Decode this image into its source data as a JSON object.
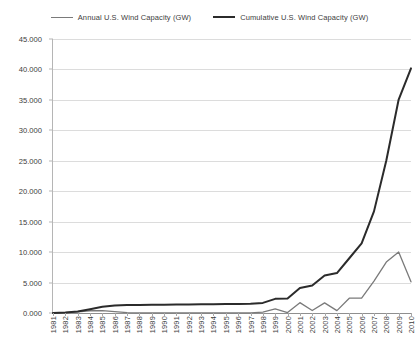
{
  "chart_data": {
    "type": "line",
    "title": "",
    "xlabel": "",
    "ylabel": "",
    "ylim": [
      0,
      45
    ],
    "ytick_interval": 5,
    "grid": "horizontal",
    "legend_position": "top-center",
    "categories": [
      "1981",
      "1982",
      "1983",
      "1984",
      "1985",
      "1986",
      "1987",
      "1988",
      "1989",
      "1990",
      "1991",
      "1992",
      "1993",
      "1994",
      "1995",
      "1996",
      "1997",
      "1998",
      "1999",
      "2000",
      "2001",
      "2002",
      "2003",
      "2004",
      "2005",
      "2006",
      "2007",
      "2008",
      "2009",
      "2010"
    ],
    "ytick_labels": [
      "0.000",
      "5.000",
      "10.000",
      "15.000",
      "20.000",
      "25.000",
      "30.000",
      "35.000",
      "40.000",
      "45.000"
    ],
    "ytick_values": [
      0,
      5,
      10,
      15,
      20,
      25,
      30,
      35,
      40,
      45
    ],
    "series": [
      {
        "name": "Annual U.S. Wind Capacity (GW)",
        "color": "#7a7a7a",
        "width": 1.3,
        "values": [
          0.01,
          0.06,
          0.17,
          0.37,
          0.4,
          0.24,
          0.05,
          0.02,
          0.02,
          0.02,
          0.02,
          0.02,
          0.02,
          0.02,
          0.03,
          0.02,
          0.03,
          0.14,
          0.66,
          0.07,
          1.7,
          0.41,
          1.67,
          0.39,
          2.43,
          2.45,
          5.25,
          8.36,
          10.01,
          5.12
        ]
      },
      {
        "name": "Cumulative U.S. Wind Capacity (GW)",
        "color": "#2b2b2b",
        "width": 2.0,
        "values": [
          0.01,
          0.07,
          0.24,
          0.61,
          1.01,
          1.25,
          1.3,
          1.32,
          1.34,
          1.36,
          1.38,
          1.4,
          1.42,
          1.44,
          1.47,
          1.49,
          1.52,
          1.66,
          2.32,
          2.39,
          4.09,
          4.5,
          6.17,
          6.56,
          8.99,
          11.44,
          16.69,
          25.05,
          35.06,
          40.18
        ]
      }
    ]
  },
  "legend": {
    "entries": [
      {
        "label": "Annual U.S. Wind Capacity (GW)",
        "swatch": "annual-line-swatch"
      },
      {
        "label": "Cumulative U.S. Wind Capacity (GW)",
        "swatch": "cumulative-line-swatch"
      }
    ]
  }
}
